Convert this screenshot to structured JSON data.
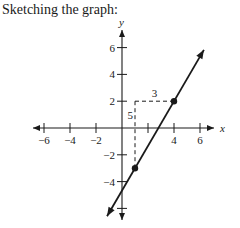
{
  "caption": "Sketching the graph:",
  "chart_data": {
    "type": "line",
    "title": "",
    "xlabel": "x",
    "ylabel": "y",
    "xlim": [
      -7,
      7
    ],
    "ylim": [
      -7,
      7
    ],
    "x_ticks": [
      -6,
      -4,
      -2,
      4,
      6
    ],
    "y_ticks": [
      6,
      4,
      2,
      -2,
      -4
    ],
    "x_minor_ticks": [
      2
    ],
    "y_minor_ticks": [
      -6
    ],
    "grid": false,
    "series": [
      {
        "name": "line",
        "equation": "y = (5/3)x - 14/3",
        "slope": 1.6667,
        "intercept": -4.6667,
        "points": [
          {
            "x": 1,
            "y": -3
          },
          {
            "x": 4,
            "y": 2
          }
        ],
        "arrows": "both"
      }
    ],
    "annotations": [
      {
        "text": "3",
        "meaning": "run",
        "from": {
          "x": 1,
          "y": 2
        },
        "to": {
          "x": 4,
          "y": 2
        }
      },
      {
        "text": "5",
        "meaning": "rise",
        "from": {
          "x": 1,
          "y": -3
        },
        "to": {
          "x": 1,
          "y": 2
        }
      }
    ]
  }
}
